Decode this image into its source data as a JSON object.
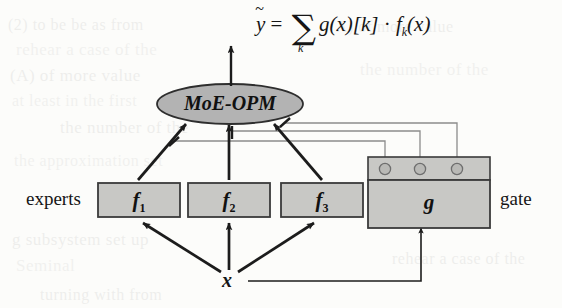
{
  "figure": {
    "type": "diagram",
    "formula": {
      "output_var": "y",
      "output_var_accent": "~",
      "equals": "=",
      "sum_symbol": "∑",
      "sum_index": "k",
      "term_gate": "g(x)[k]",
      "dot": "·",
      "term_expert": "f",
      "term_expert_sub": "k",
      "term_expert_arg": "(x)",
      "full_text": "ỹ = ∑ₖ g(x)[k] · fₖ(x)"
    },
    "nodes": {
      "aggregator": {
        "label": "MoE-OPM",
        "shape": "ellipse",
        "fill": "#b3b3b3"
      },
      "experts_group_label": "experts",
      "gate_group_label": "gate",
      "input_label": "x",
      "experts": [
        {
          "label": "f",
          "sub": "1",
          "name": "expert-f1"
        },
        {
          "label": "f",
          "sub": "2",
          "name": "expert-f2"
        },
        {
          "label": "f",
          "sub": "3",
          "name": "expert-f3"
        }
      ],
      "gate": {
        "label": "g",
        "name": "gate-box",
        "ports": 3
      }
    },
    "colors": {
      "page_background": "#fcfcfa",
      "box_fill": "#c8c8c5",
      "box_stroke": "#3a3a3a",
      "ellipse_fill": "#b3b3b3",
      "ellipse_stroke": "#2e2e2e",
      "thick_edge": "#1c1c1c",
      "thin_edge": "#8c8c8c",
      "text": "#151515",
      "port_fill": "#b9b9b6"
    },
    "edges": [
      {
        "from": "x",
        "to": "expert-f1",
        "style": "thick-arrow"
      },
      {
        "from": "x",
        "to": "expert-f2",
        "style": "thick-arrow"
      },
      {
        "from": "x",
        "to": "expert-f3",
        "style": "thick-arrow"
      },
      {
        "from": "x",
        "to": "gate-box",
        "style": "thin-line"
      },
      {
        "from": "expert-f1",
        "to": "aggregator",
        "style": "thick-arrow"
      },
      {
        "from": "expert-f2",
        "to": "aggregator",
        "style": "thick-arrow"
      },
      {
        "from": "expert-f3",
        "to": "aggregator",
        "style": "thick-arrow"
      },
      {
        "from": "gate-port-1",
        "to": "edge-f1-aggregator",
        "style": "thin-modulation"
      },
      {
        "from": "gate-port-2",
        "to": "edge-f2-aggregator",
        "style": "thin-modulation"
      },
      {
        "from": "gate-port-3",
        "to": "edge-f3-aggregator",
        "style": "thin-modulation"
      },
      {
        "from": "aggregator",
        "to": "output",
        "style": "thick-arrow"
      }
    ]
  },
  "background_ghost_text": [
    "(2) to be be as from",
    "rehear a case of the",
    "(A) of more value",
    "at least in the first",
    "the number of the",
    "the approximation set",
    "g subsystem set up",
    "Seminal",
    "turning with from"
  ]
}
